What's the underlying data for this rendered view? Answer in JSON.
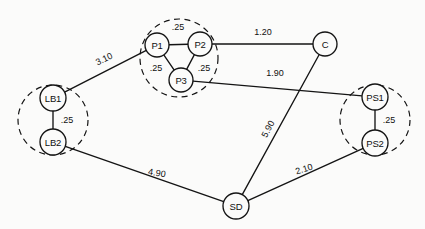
{
  "diagram": {
    "type": "network-graph",
    "title": "",
    "background_color": "#fbfbfa",
    "line_color": "#141414",
    "nodes": [
      {
        "id": "P1",
        "label": "P1",
        "x": 157,
        "y": 45,
        "r": 12
      },
      {
        "id": "P2",
        "label": "P2",
        "x": 200,
        "y": 44,
        "r": 12
      },
      {
        "id": "P3",
        "label": "P3",
        "x": 181,
        "y": 80,
        "r": 12
      },
      {
        "id": "C",
        "label": "C",
        "x": 325,
        "y": 44,
        "r": 12
      },
      {
        "id": "LB1",
        "label": "LB1",
        "x": 53,
        "y": 98,
        "r": 13
      },
      {
        "id": "LB2",
        "label": "LB2",
        "x": 53,
        "y": 142,
        "r": 13
      },
      {
        "id": "PS1",
        "label": "PS1",
        "x": 375,
        "y": 97,
        "r": 13
      },
      {
        "id": "PS2",
        "label": "PS2",
        "x": 375,
        "y": 143,
        "r": 13
      },
      {
        "id": "SD",
        "label": "SD",
        "x": 236,
        "y": 206,
        "r": 13
      }
    ],
    "clusters": [
      {
        "id": "cluster-p",
        "cx": 179,
        "cy": 58,
        "r": 39,
        "members": [
          "P1",
          "P2",
          "P3"
        ]
      },
      {
        "id": "cluster-lb",
        "cx": 53,
        "cy": 120,
        "r": 35,
        "members": [
          "LB1",
          "LB2"
        ]
      },
      {
        "id": "cluster-ps",
        "cx": 375,
        "cy": 120,
        "r": 35,
        "members": [
          "PS1",
          "PS2"
        ]
      }
    ],
    "edges": [
      {
        "id": "edge-p1-p2",
        "from": "P1",
        "to": "P2",
        "label": ".25",
        "lx": 178,
        "ly": 27,
        "rot": 0
      },
      {
        "id": "edge-p1-p3",
        "from": "P1",
        "to": "P3",
        "label": ".25",
        "lx": 156,
        "ly": 68,
        "rot": 0
      },
      {
        "id": "edge-p2-p3",
        "from": "P2",
        "to": "P3",
        "label": ".25",
        "lx": 204,
        "ly": 68,
        "rot": 0
      },
      {
        "id": "edge-p2-c",
        "from": "P2",
        "to": "C",
        "label": "1.20",
        "lx": 263,
        "ly": 32,
        "rot": 0
      },
      {
        "id": "edge-p3-ps1",
        "from": "P3",
        "to": "PS1",
        "label": "1.90",
        "lx": 275,
        "ly": 73,
        "rot": 0
      },
      {
        "id": "edge-lb1-p1",
        "from": "LB1",
        "to": "P1",
        "label": "3.10",
        "lx": 104,
        "ly": 59,
        "rot": -26
      },
      {
        "id": "edge-lb1-lb2",
        "from": "LB1",
        "to": "LB2",
        "label": ".25",
        "lx": 67,
        "ly": 120,
        "rot": 0
      },
      {
        "id": "edge-ps1-ps2",
        "from": "PS1",
        "to": "PS2",
        "label": ".25",
        "lx": 389,
        "ly": 120,
        "rot": 0
      },
      {
        "id": "edge-c-sd",
        "from": "C",
        "to": "SD",
        "label": "5.90",
        "lx": 268,
        "ly": 129,
        "rot": -62
      },
      {
        "id": "edge-lb2-sd",
        "from": "LB2",
        "to": "SD",
        "label": "4.90",
        "lx": 157,
        "ly": 173,
        "rot": 9
      },
      {
        "id": "edge-sd-ps2",
        "from": "SD",
        "to": "PS2",
        "label": "2.10",
        "lx": 304,
        "ly": 169,
        "rot": -17
      }
    ]
  }
}
